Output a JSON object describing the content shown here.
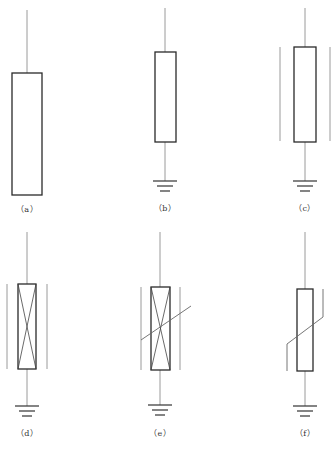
{
  "colors": {
    "background": "#ffffff",
    "wire": "#9a9a9a",
    "box": "#2a2a2a",
    "text": "#333333"
  },
  "figures": [
    {
      "id": "a",
      "caption": "（a）",
      "cx": 27,
      "wireTop": 10,
      "box": {
        "x": 12,
        "y": 73,
        "w": 30,
        "h": 122
      },
      "bottomWire": null,
      "ground": null,
      "shields": [],
      "cross": false,
      "slash": null,
      "captionY": 208
    },
    {
      "id": "b",
      "caption": "（b）",
      "cx": 165,
      "wireTop": 8,
      "box": {
        "x": 155,
        "y": 52,
        "w": 21,
        "h": 90
      },
      "bottomWire": 181,
      "ground": {
        "y": 181
      },
      "shields": [],
      "cross": false,
      "slash": null,
      "captionY": 207
    },
    {
      "id": "c",
      "caption": "（c）",
      "cx": 305,
      "wireTop": 8,
      "box": {
        "x": 294,
        "y": 47,
        "w": 22,
        "h": 95
      },
      "bottomWire": 181,
      "ground": {
        "y": 181
      },
      "shields": [
        280,
        330
      ],
      "shieldTop": 47,
      "shieldBottom": 141,
      "cross": false,
      "slash": null,
      "captionY": 207
    },
    {
      "id": "d",
      "caption": "（d）",
      "cx": 27,
      "wireTop": 232,
      "box": {
        "x": 18,
        "y": 284,
        "w": 18,
        "h": 85
      },
      "bottomWire": 406,
      "ground": {
        "y": 406
      },
      "shields": [
        7,
        47
      ],
      "shieldTop": 284,
      "shieldBottom": 369,
      "cross": true,
      "slash": null,
      "captionY": 432
    },
    {
      "id": "e",
      "caption": "（e）",
      "cx": 160,
      "wireTop": 232,
      "box": {
        "x": 151,
        "y": 287,
        "w": 19,
        "h": 83
      },
      "bottomWire": 405,
      "ground": {
        "y": 405
      },
      "shields": [
        141,
        180
      ],
      "shieldTop": 287,
      "shieldBottom": 370,
      "cross": true,
      "slash": {
        "type": "straight",
        "x1": 141,
        "y1": 340,
        "x2": 191,
        "y2": 306
      },
      "captionY": 432
    },
    {
      "id": "f",
      "caption": "（f）",
      "cx": 305,
      "wireTop": 232,
      "box": {
        "x": 297,
        "y": 289,
        "w": 16,
        "h": 82
      },
      "bottomWire": 406,
      "ground": {
        "y": 406
      },
      "shields": [],
      "cross": false,
      "slash": {
        "type": "varistor",
        "points": "287,371 287,344 323,317 323,289"
      },
      "captionY": 432
    }
  ]
}
